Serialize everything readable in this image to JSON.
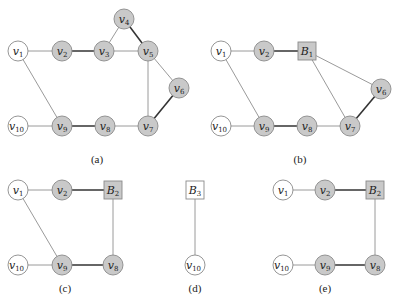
{
  "colors": {
    "shaded_fill": "#c9c9c9",
    "white_fill": "#ffffff",
    "outline": "#8a8a8a",
    "thin_edge": "#8f8f8f",
    "thick_edge": "#333333"
  },
  "panels": [
    {
      "id": "a",
      "label": "(a)",
      "label_pos": [
        97,
        163
      ],
      "nodes": [
        {
          "id": "v1",
          "name": "v",
          "sub": "1",
          "x": 18,
          "y": 51,
          "shape": "circle",
          "shaded": false
        },
        {
          "id": "v2",
          "name": "v",
          "sub": "2",
          "x": 62,
          "y": 51,
          "shape": "circle",
          "shaded": true
        },
        {
          "id": "v3",
          "name": "v",
          "sub": "3",
          "x": 104,
          "y": 51,
          "shape": "circle",
          "shaded": true
        },
        {
          "id": "v4",
          "name": "v",
          "sub": "4",
          "x": 124,
          "y": 19,
          "shape": "circle",
          "shaded": true
        },
        {
          "id": "v5",
          "name": "v",
          "sub": "5",
          "x": 148,
          "y": 51,
          "shape": "circle",
          "shaded": true
        },
        {
          "id": "v6",
          "name": "v",
          "sub": "6",
          "x": 179,
          "y": 88,
          "shape": "circle",
          "shaded": true
        },
        {
          "id": "v7",
          "name": "v",
          "sub": "7",
          "x": 148,
          "y": 126,
          "shape": "circle",
          "shaded": true
        },
        {
          "id": "v8",
          "name": "v",
          "sub": "8",
          "x": 105,
          "y": 126,
          "shape": "circle",
          "shaded": true
        },
        {
          "id": "v9",
          "name": "v",
          "sub": "9",
          "x": 62,
          "y": 126,
          "shape": "circle",
          "shaded": true
        },
        {
          "id": "v10",
          "name": "v",
          "sub": "10",
          "x": 18,
          "y": 126,
          "shape": "circle",
          "shaded": false
        }
      ],
      "edges": [
        {
          "from": "v1",
          "to": "v2",
          "thick": false
        },
        {
          "from": "v2",
          "to": "v3",
          "thick": true
        },
        {
          "from": "v3",
          "to": "v5",
          "thick": false
        },
        {
          "from": "v3",
          "to": "v4",
          "thick": false
        },
        {
          "from": "v4",
          "to": "v5",
          "thick": true
        },
        {
          "from": "v5",
          "to": "v6",
          "thick": false
        },
        {
          "from": "v5",
          "to": "v7",
          "thick": false
        },
        {
          "from": "v6",
          "to": "v7",
          "thick": true
        },
        {
          "from": "v7",
          "to": "v8",
          "thick": false
        },
        {
          "from": "v8",
          "to": "v9",
          "thick": true
        },
        {
          "from": "v9",
          "to": "v10",
          "thick": false
        },
        {
          "from": "v1",
          "to": "v9",
          "thick": false
        }
      ]
    },
    {
      "id": "b",
      "label": "(b)",
      "label_pos": [
        300,
        163
      ],
      "nodes": [
        {
          "id": "v1",
          "name": "v",
          "sub": "1",
          "x": 221,
          "y": 51,
          "shape": "circle",
          "shaded": false
        },
        {
          "id": "v2",
          "name": "v",
          "sub": "2",
          "x": 264,
          "y": 51,
          "shape": "circle",
          "shaded": true
        },
        {
          "id": "B1",
          "name": "B",
          "sub": "1",
          "x": 307,
          "y": 51,
          "shape": "square",
          "shaded": true
        },
        {
          "id": "v6",
          "name": "v",
          "sub": "6",
          "x": 381,
          "y": 89,
          "shape": "circle",
          "shaded": true
        },
        {
          "id": "v7",
          "name": "v",
          "sub": "7",
          "x": 350,
          "y": 126,
          "shape": "circle",
          "shaded": true
        },
        {
          "id": "v8",
          "name": "v",
          "sub": "8",
          "x": 307,
          "y": 126,
          "shape": "circle",
          "shaded": true
        },
        {
          "id": "v9",
          "name": "v",
          "sub": "9",
          "x": 264,
          "y": 126,
          "shape": "circle",
          "shaded": true
        },
        {
          "id": "v10",
          "name": "v",
          "sub": "10",
          "x": 221,
          "y": 126,
          "shape": "circle",
          "shaded": false
        }
      ],
      "edges": [
        {
          "from": "v1",
          "to": "v2",
          "thick": false
        },
        {
          "from": "v2",
          "to": "B1",
          "thick": true
        },
        {
          "from": "B1",
          "to": "v6",
          "thick": false
        },
        {
          "from": "B1",
          "to": "v7",
          "thick": false
        },
        {
          "from": "v6",
          "to": "v7",
          "thick": true
        },
        {
          "from": "v7",
          "to": "v8",
          "thick": false
        },
        {
          "from": "v8",
          "to": "v9",
          "thick": true
        },
        {
          "from": "v9",
          "to": "v10",
          "thick": false
        },
        {
          "from": "v1",
          "to": "v9",
          "thick": false
        }
      ]
    },
    {
      "id": "c",
      "label": "(c)",
      "label_pos": [
        65,
        292
      ],
      "nodes": [
        {
          "id": "v1",
          "name": "v",
          "sub": "1",
          "x": 18,
          "y": 190,
          "shape": "circle",
          "shaded": false
        },
        {
          "id": "v2",
          "name": "v",
          "sub": "2",
          "x": 62,
          "y": 190,
          "shape": "circle",
          "shaded": true
        },
        {
          "id": "B2",
          "name": "B",
          "sub": "2",
          "x": 113,
          "y": 190,
          "shape": "square",
          "shaded": true
        },
        {
          "id": "v8",
          "name": "v",
          "sub": "8",
          "x": 113,
          "y": 265,
          "shape": "circle",
          "shaded": true
        },
        {
          "id": "v9",
          "name": "v",
          "sub": "9",
          "x": 62,
          "y": 265,
          "shape": "circle",
          "shaded": true
        },
        {
          "id": "v10",
          "name": "v",
          "sub": "10",
          "x": 18,
          "y": 265,
          "shape": "circle",
          "shaded": false
        }
      ],
      "edges": [
        {
          "from": "v1",
          "to": "v2",
          "thick": false
        },
        {
          "from": "v2",
          "to": "B2",
          "thick": true
        },
        {
          "from": "B2",
          "to": "v8",
          "thick": false
        },
        {
          "from": "v8",
          "to": "v9",
          "thick": true
        },
        {
          "from": "v9",
          "to": "v10",
          "thick": false
        },
        {
          "from": "v1",
          "to": "v9",
          "thick": false
        }
      ]
    },
    {
      "id": "d",
      "label": "(d)",
      "label_pos": [
        195,
        292
      ],
      "nodes": [
        {
          "id": "B3",
          "name": "B",
          "sub": "3",
          "x": 195,
          "y": 190,
          "shape": "square",
          "shaded": false
        },
        {
          "id": "v10",
          "name": "v",
          "sub": "10",
          "x": 195,
          "y": 265,
          "shape": "circle",
          "shaded": false
        }
      ],
      "edges": [
        {
          "from": "B3",
          "to": "v10",
          "thick": false
        }
      ]
    },
    {
      "id": "e",
      "label": "(e)",
      "label_pos": [
        325,
        292
      ],
      "nodes": [
        {
          "id": "v1",
          "name": "v",
          "sub": "1",
          "x": 283,
          "y": 190,
          "shape": "circle",
          "shaded": false
        },
        {
          "id": "v2",
          "name": "v",
          "sub": "2",
          "x": 325,
          "y": 190,
          "shape": "circle",
          "shaded": true
        },
        {
          "id": "B2",
          "name": "B",
          "sub": "2",
          "x": 375,
          "y": 190,
          "shape": "square",
          "shaded": true
        },
        {
          "id": "v8",
          "name": "v",
          "sub": "8",
          "x": 375,
          "y": 265,
          "shape": "circle",
          "shaded": true
        },
        {
          "id": "v9",
          "name": "v",
          "sub": "9",
          "x": 325,
          "y": 265,
          "shape": "circle",
          "shaded": true
        },
        {
          "id": "v10",
          "name": "v",
          "sub": "10",
          "x": 283,
          "y": 265,
          "shape": "circle",
          "shaded": false
        }
      ],
      "edges": [
        {
          "from": "v1",
          "to": "v2",
          "thick": false
        },
        {
          "from": "v2",
          "to": "B2",
          "thick": true
        },
        {
          "from": "B2",
          "to": "v8",
          "thick": false
        },
        {
          "from": "v8",
          "to": "v9",
          "thick": true
        },
        {
          "from": "v9",
          "to": "v10",
          "thick": false
        }
      ]
    }
  ]
}
